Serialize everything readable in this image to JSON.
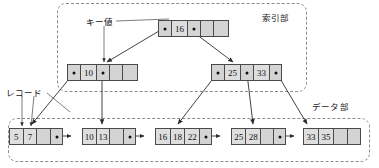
{
  "diagram": {
    "title_sections": {
      "index_label": "索引部",
      "data_label": "データ部"
    },
    "callouts": {
      "key_value": "キー値",
      "record": "レコード"
    }
  },
  "nodes": {
    "root": {
      "name": "root-index-node",
      "cells": [
        {
          "type": "pointer",
          "text": ""
        },
        {
          "type": "key",
          "text": "16"
        },
        {
          "type": "pointer",
          "text": ""
        },
        {
          "type": "empty",
          "text": ""
        },
        {
          "type": "empty",
          "text": ""
        }
      ]
    },
    "inner_left": {
      "name": "inner-node-left",
      "cells": [
        {
          "type": "pointer",
          "text": ""
        },
        {
          "type": "key",
          "text": "10"
        },
        {
          "type": "pointer",
          "text": ""
        },
        {
          "type": "empty",
          "text": ""
        },
        {
          "type": "empty",
          "text": ""
        }
      ]
    },
    "inner_right": {
      "name": "inner-node-right",
      "cells": [
        {
          "type": "pointer",
          "text": ""
        },
        {
          "type": "key",
          "text": "25"
        },
        {
          "type": "pointer",
          "text": ""
        },
        {
          "type": "key",
          "text": "33"
        },
        {
          "type": "pointer",
          "text": ""
        }
      ]
    },
    "leaves": [
      {
        "name": "leaf-node-1",
        "cells": [
          {
            "type": "key",
            "text": "5"
          },
          {
            "type": "key",
            "text": "7"
          },
          {
            "type": "empty",
            "text": ""
          },
          {
            "type": "pointer",
            "text": ""
          }
        ]
      },
      {
        "name": "leaf-node-2",
        "cells": [
          {
            "type": "key",
            "text": "10"
          },
          {
            "type": "key",
            "text": "13"
          },
          {
            "type": "empty",
            "text": ""
          },
          {
            "type": "pointer",
            "text": ""
          }
        ]
      },
      {
        "name": "leaf-node-3",
        "cells": [
          {
            "type": "key",
            "text": "16"
          },
          {
            "type": "key",
            "text": "18"
          },
          {
            "type": "key",
            "text": "22"
          },
          {
            "type": "pointer",
            "text": ""
          }
        ]
      },
      {
        "name": "leaf-node-4",
        "cells": [
          {
            "type": "key",
            "text": "25"
          },
          {
            "type": "key",
            "text": "28"
          },
          {
            "type": "empty",
            "text": ""
          },
          {
            "type": "pointer",
            "text": ""
          }
        ]
      },
      {
        "name": "leaf-node-5",
        "cells": [
          {
            "type": "key",
            "text": "33"
          },
          {
            "type": "key",
            "text": "35"
          },
          {
            "type": "empty",
            "text": ""
          },
          {
            "type": "empty",
            "text": ""
          }
        ]
      }
    ]
  },
  "colors": {
    "node_fill": "#d4d4d4",
    "node_stroke": "#4a4a4a",
    "section_stroke": "#8a8a8a",
    "text": "#111111"
  }
}
